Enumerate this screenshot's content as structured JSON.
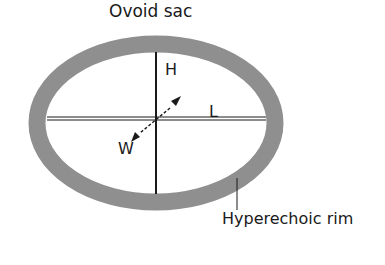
{
  "diagram": {
    "title": "Ovoid sac",
    "axis_labels": {
      "height": "H",
      "length": "L",
      "width": "W"
    },
    "callout": "Hyperechoic rim",
    "colors": {
      "rim": "#8f8f8f",
      "lines": "#1a1a1a",
      "background": "#ffffff"
    }
  }
}
